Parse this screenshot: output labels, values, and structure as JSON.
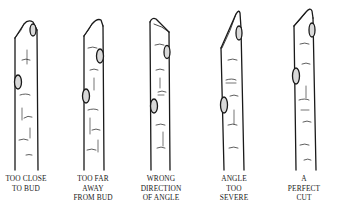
{
  "figure": {
    "colors": {
      "ink": "#1a1a1a",
      "background": "#ffffff"
    },
    "examples": [
      {
        "id": "too-close",
        "label_lines": [
          "TOO CLOSE",
          "TO BUD"
        ]
      },
      {
        "id": "too-far",
        "label_lines": [
          "TOO FAR",
          "AWAY",
          "FROM BUD"
        ]
      },
      {
        "id": "wrong-direction",
        "label_lines": [
          "WRONG",
          "DIRECTION",
          "OF ANGLE"
        ]
      },
      {
        "id": "too-severe",
        "label_lines": [
          "ANGLE",
          "TOO",
          "SEVERE"
        ]
      },
      {
        "id": "perfect",
        "label_lines": [
          "A",
          "PERFECT",
          "CUT"
        ]
      }
    ]
  }
}
